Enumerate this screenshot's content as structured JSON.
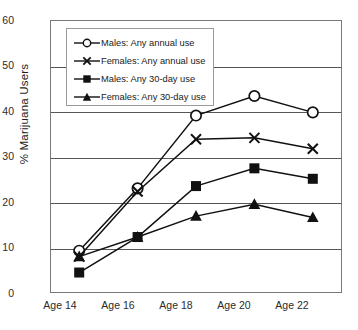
{
  "chart_data": {
    "type": "line",
    "title": "",
    "xlabel": "",
    "ylabel": "% Marijuana Users",
    "categories": [
      "Age 14",
      "Age 16",
      "Age 18",
      "Age 20",
      "Age 22"
    ],
    "ylim": [
      0,
      60
    ],
    "ytick_labels": [
      "0",
      "10",
      "20",
      "30",
      "40",
      "50",
      "60"
    ],
    "ytick_values": [
      0,
      10,
      20,
      30,
      40,
      50,
      60
    ],
    "grid": "horizontal",
    "legend_position": "upper-left-inside",
    "series": [
      {
        "name": "Males: Any annual use",
        "marker": "open-circle",
        "values": [
          9.3,
          23.0,
          39.0,
          43.3,
          39.7
        ]
      },
      {
        "name": "Females: Any annual use",
        "marker": "x-cross",
        "values": [
          8.0,
          22.3,
          33.8,
          34.1,
          31.7
        ]
      },
      {
        "name": "Males: Any 30-day use",
        "marker": "filled-square",
        "values": [
          4.5,
          12.3,
          23.5,
          27.4,
          25.1
        ]
      },
      {
        "name": "Females: Any 30-day use",
        "marker": "filled-triangle",
        "values": [
          8.0,
          12.3,
          16.9,
          19.5,
          16.6
        ]
      }
    ],
    "colors": {
      "series_line": "#111111",
      "gridline": "#55565a",
      "frame": "#7a7a7a",
      "text": "#1e1e1e",
      "background": "#ffffff"
    }
  },
  "legend": {
    "items": [
      {
        "label": "Males: Any annual use",
        "icon": "open-circle-marker-icon"
      },
      {
        "label": "Females: Any annual use",
        "icon": "x-cross-marker-icon"
      },
      {
        "label": "Males: Any 30-day use",
        "icon": "filled-square-marker-icon"
      },
      {
        "label": "Females: Any 30-day use",
        "icon": "filled-triangle-marker-icon"
      }
    ]
  }
}
